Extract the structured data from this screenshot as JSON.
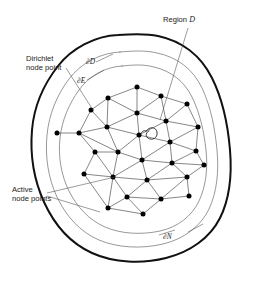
{
  "figure": {
    "labels": {
      "region": {
        "text": "Region ",
        "symbol": "D"
      },
      "dirichlet_line1": "Dirichlet",
      "dirichlet_line2": "node point",
      "active_line1": "Active",
      "active_line2": "node points",
      "boundary_d": "∂D",
      "boundary_e": "∂E",
      "boundary_n": "∂N"
    },
    "colors": {
      "outer_boundary": "#111111",
      "inner_boundary": "#6b6b6b",
      "mesh_edge": "#3a3a3a",
      "node": "#000000",
      "leader": "#4a4a4a",
      "text": "#1a1a1a",
      "background": "#ffffff"
    },
    "geometry": {
      "width": 259,
      "height": 282,
      "boundary_outer_path": "M 118 35 C 95 36 72 48 58 66 C 44 84 34 106 32 130 C 30 154 34 180 44 202 C 54 224 70 243 92 253 C 114 263 142 264 166 258 C 190 252 210 238 220 218 C 230 198 232 174 230 150 C 228 126 223 100 212 78 C 201 56 182 41 158 36 C 145 33 131 34 118 35 Z",
      "boundary_mid_path": "M 120 52 C 100 53 81 63 69 79 C 57 95 49 114 47 135 C 45 156 48 178 57 197 C 66 216 80 232 99 240 C 118 248 142 249 163 244 C 184 239 201 226 209 209 C 217 192 219 171 217 150 C 215 129 211 107 202 88 C 193 69 177 57 157 53 C 145 50 132 51 120 52 Z",
      "boundary_inner_path": "M 122 66 C 105 67 89 76 79 90 C 69 104 62 120 60 138 C 58 156 61 175 69 191 C 77 207 89 220 105 227 C 121 234 142 235 160 231 C 178 227 192 216 199 201 C 206 186 208 168 206 150 C 204 132 200 113 192 97 C 184 81 171 71 154 67 C 143 64 132 65 122 66 Z",
      "nodes": [
        [
          137,
          87
        ],
        [
          108,
          98
        ],
        [
          161,
          96
        ],
        [
          187,
          104
        ],
        [
          91,
          110
        ],
        [
          137,
          113
        ],
        [
          166,
          121
        ],
        [
          107,
          127
        ],
        [
          198,
          127
        ],
        [
          79,
          133
        ],
        [
          139,
          135
        ],
        [
          57,
          133
        ],
        [
          170,
          142
        ],
        [
          95,
          152
        ],
        [
          118,
          152
        ],
        [
          196,
          151
        ],
        [
          142,
          160
        ],
        [
          172,
          163
        ],
        [
          84,
          174
        ],
        [
          113,
          177
        ],
        [
          147,
          180
        ],
        [
          187,
          177
        ],
        [
          204,
          165
        ],
        [
          127,
          197
        ],
        [
          161,
          199
        ],
        [
          189,
          196
        ],
        [
          108,
          208
        ],
        [
          143,
          214
        ]
      ],
      "mesh_edges": [
        [
          137,
          87,
          108,
          98
        ],
        [
          137,
          87,
          161,
          96
        ],
        [
          137,
          87,
          137,
          113
        ],
        [
          108,
          98,
          91,
          110
        ],
        [
          108,
          98,
          137,
          113
        ],
        [
          108,
          98,
          107,
          127
        ],
        [
          161,
          96,
          187,
          104
        ],
        [
          161,
          96,
          137,
          113
        ],
        [
          161,
          96,
          166,
          121
        ],
        [
          187,
          104,
          166,
          121
        ],
        [
          187,
          104,
          198,
          127
        ],
        [
          91,
          110,
          107,
          127
        ],
        [
          91,
          110,
          79,
          133
        ],
        [
          137,
          113,
          107,
          127
        ],
        [
          137,
          113,
          139,
          135
        ],
        [
          137,
          113,
          166,
          121
        ],
        [
          166,
          121,
          139,
          135
        ],
        [
          166,
          121,
          170,
          142
        ],
        [
          166,
          121,
          198,
          127
        ],
        [
          198,
          127,
          170,
          142
        ],
        [
          198,
          127,
          196,
          151
        ],
        [
          107,
          127,
          79,
          133
        ],
        [
          107,
          127,
          139,
          135
        ],
        [
          107,
          127,
          118,
          152
        ],
        [
          79,
          133,
          57,
          133
        ],
        [
          79,
          133,
          95,
          152
        ],
        [
          79,
          133,
          118,
          152
        ],
        [
          139,
          135,
          118,
          152
        ],
        [
          139,
          135,
          142,
          160
        ],
        [
          139,
          135,
          170,
          142
        ],
        [
          170,
          142,
          142,
          160
        ],
        [
          170,
          142,
          172,
          163
        ],
        [
          170,
          142,
          196,
          151
        ],
        [
          196,
          151,
          172,
          163
        ],
        [
          196,
          151,
          204,
          165
        ],
        [
          95,
          152,
          118,
          152
        ],
        [
          95,
          152,
          84,
          174
        ],
        [
          95,
          152,
          113,
          177
        ],
        [
          118,
          152,
          142,
          160
        ],
        [
          118,
          152,
          113,
          177
        ],
        [
          142,
          160,
          113,
          177
        ],
        [
          142,
          160,
          147,
          180
        ],
        [
          142,
          160,
          172,
          163
        ],
        [
          172,
          163,
          147,
          180
        ],
        [
          172,
          163,
          187,
          177
        ],
        [
          172,
          163,
          204,
          165
        ],
        [
          204,
          165,
          187,
          177
        ],
        [
          84,
          174,
          113,
          177
        ],
        [
          84,
          174,
          108,
          208
        ],
        [
          113,
          177,
          147,
          180
        ],
        [
          113,
          177,
          108,
          208
        ],
        [
          113,
          177,
          127,
          197
        ],
        [
          147,
          180,
          127,
          197
        ],
        [
          147,
          180,
          161,
          199
        ],
        [
          147,
          180,
          187,
          177
        ],
        [
          187,
          177,
          161,
          199
        ],
        [
          187,
          177,
          189,
          196
        ],
        [
          127,
          197,
          108,
          208
        ],
        [
          127,
          197,
          143,
          214
        ],
        [
          127,
          197,
          161,
          199
        ],
        [
          161,
          199,
          143,
          214
        ],
        [
          161,
          199,
          189,
          196
        ],
        [
          108,
          208,
          143,
          214
        ]
      ],
      "leaders": [
        {
          "name": "region-leader",
          "d": "M 188 28 L 160 120"
        },
        {
          "name": "dirichlet-leader",
          "d": "M 66 68 L 93 110"
        },
        {
          "name": "active-leader-1",
          "d": "M 47 193 L 115 177"
        },
        {
          "name": "active-leader-2",
          "d": "M 47 196 L 100 212"
        },
        {
          "name": "boundary-d-leader",
          "d": "M 96 62 L 113 54"
        },
        {
          "name": "boundary-e-leader",
          "d": "M 87 80 L 104 70"
        },
        {
          "name": "boundary-n-leader",
          "d": "M 159 235 L 175 230"
        },
        {
          "name": "boundary-n-leader-2",
          "d": "M 188 232 L 203 224"
        }
      ],
      "label_positions": {
        "region": {
          "x": 163,
          "y": 22
        },
        "dirichlet_line1": {
          "x": 26,
          "y": 61
        },
        "dirichlet_line2": {
          "x": 26,
          "y": 70
        },
        "active_line1": {
          "x": 12,
          "y": 192
        },
        "active_line2": {
          "x": 12,
          "y": 201
        },
        "boundary_d": {
          "x": 86,
          "y": 64
        },
        "boundary_e": {
          "x": 77,
          "y": 83
        },
        "boundary_n": {
          "x": 163,
          "y": 239
        }
      }
    }
  }
}
